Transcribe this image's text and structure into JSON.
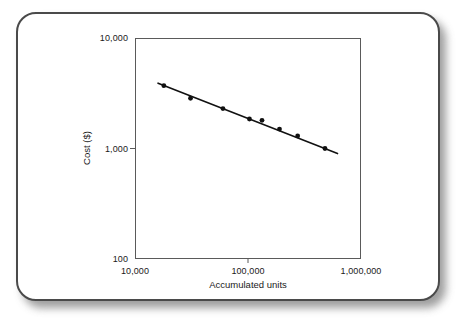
{
  "chart_data": {
    "type": "scatter",
    "title": "",
    "subtitle": "",
    "xlabel": "Accumulated units",
    "ylabel": "Cost ($)",
    "xscale": "log",
    "yscale": "log",
    "xlim": [
      10000,
      1000000
    ],
    "ylim": [
      100,
      10000
    ],
    "grid": false,
    "legend": null,
    "x_ticks": [
      {
        "value": 10000,
        "label": "10,000"
      },
      {
        "value": 100000,
        "label": "100,000"
      },
      {
        "value": 1000000,
        "label": "1,000,000"
      }
    ],
    "y_ticks": [
      {
        "value": 10000,
        "label": "10,000"
      },
      {
        "value": 1000,
        "label": "1,000"
      },
      {
        "value": 100,
        "label": "100"
      }
    ],
    "series": [
      {
        "name": "Observed unit cost",
        "type": "scatter",
        "marker": "filled-circle",
        "color": "#111111",
        "points": [
          {
            "x": 18000,
            "y": 3700
          },
          {
            "x": 31000,
            "y": 2850
          },
          {
            "x": 60000,
            "y": 2300
          },
          {
            "x": 103000,
            "y": 1850
          },
          {
            "x": 133000,
            "y": 1800
          },
          {
            "x": 190000,
            "y": 1500
          },
          {
            "x": 275000,
            "y": 1300
          },
          {
            "x": 480000,
            "y": 1000
          }
        ]
      },
      {
        "name": "Fitted learning curve",
        "type": "line",
        "color": "#111111",
        "points": [
          {
            "x": 16000,
            "y": 3900
          },
          {
            "x": 620000,
            "y": 900
          }
        ]
      }
    ]
  },
  "figure": {
    "x_axis_title": "Accumulated units",
    "y_axis_title": "Cost ($)"
  },
  "style": {
    "card_border_color": "#4a4a4a",
    "card_background": "#ffffff",
    "axis_color": "#5a5a5a",
    "ink_color": "#111111",
    "page_background": "#ffffff"
  }
}
